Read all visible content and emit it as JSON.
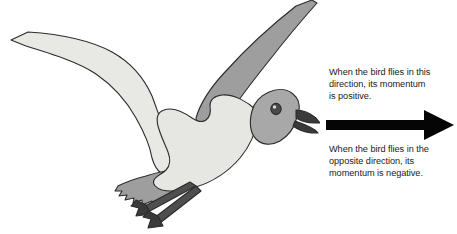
{
  "figure": {
    "illustration": {
      "subject": "seagull-in-flight",
      "facing": "right",
      "colors": {
        "body": "#e6e6e3",
        "near_wing": "#e8e8e5",
        "far_wing": "#9e9e9e",
        "head": "#a8a8a8",
        "tail": "#9e9e9e",
        "beak": "#3a3a3a",
        "eye": "#4a4a4a",
        "legs": "#4f4f4f",
        "feet": "#3a3a3a",
        "outline": "#2b2b2b"
      }
    },
    "annotations": {
      "positive": {
        "line1": "When the bird flies in this",
        "line2": "direction, its momentum",
        "line3": "is positive."
      },
      "negative": {
        "line1": "When the bird flies in the",
        "line2": "opposite direction, its",
        "line3": "momentum is negative."
      }
    },
    "arrow": {
      "name": "rightward-direction-arrow",
      "direction": "right",
      "color": "#050505"
    }
  }
}
